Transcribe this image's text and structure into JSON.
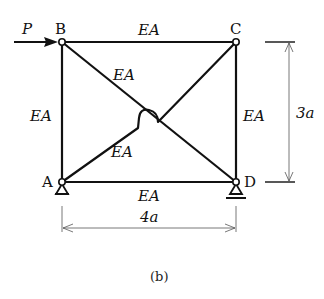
{
  "figure": {
    "caption": "(b)",
    "load": {
      "label": "P",
      "direction": "right",
      "node": "B"
    },
    "nodes": [
      {
        "id": "B",
        "label": "B"
      },
      {
        "id": "C",
        "label": "C"
      },
      {
        "id": "A",
        "label": "A",
        "support": "pin"
      },
      {
        "id": "D",
        "label": "D",
        "support": "roller"
      }
    ],
    "members": [
      {
        "from": "B",
        "to": "C",
        "label": "EA"
      },
      {
        "from": "A",
        "to": "B",
        "label": "EA"
      },
      {
        "from": "C",
        "to": "D",
        "label": "EA"
      },
      {
        "from": "A",
        "to": "D",
        "label": "EA"
      },
      {
        "from": "B",
        "to": "D",
        "label": "EA"
      },
      {
        "from": "A",
        "to": "C",
        "label": "EA"
      }
    ],
    "dimensions": {
      "width": "4a",
      "height": "3a"
    }
  }
}
